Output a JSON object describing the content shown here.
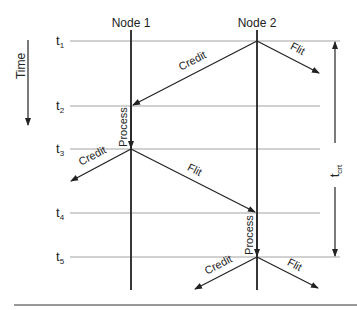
{
  "diagram": {
    "time_axis_label": "Time",
    "nodes": [
      {
        "label": "Node 1"
      },
      {
        "label": "Node 2"
      }
    ],
    "time_marks": [
      {
        "base": "t",
        "sub": "1"
      },
      {
        "base": "t",
        "sub": "2"
      },
      {
        "base": "t",
        "sub": "3"
      },
      {
        "base": "t",
        "sub": "4"
      },
      {
        "base": "t",
        "sub": "5"
      }
    ],
    "messages": {
      "credit_t1": "Credit",
      "flit_t1": "Flit",
      "process_node1": "Process",
      "credit_t3": "Credit",
      "flit_t3": "Flit",
      "process_node2": "Process",
      "credit_t5": "Credit",
      "flit_t5": "Flit"
    },
    "round_trip": {
      "base": "t",
      "sub": "crt"
    },
    "colors": {
      "line": "#222222",
      "timeline": "#888888"
    }
  }
}
